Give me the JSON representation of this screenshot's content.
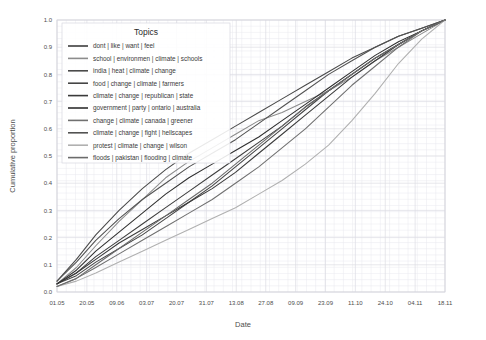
{
  "chart_data": {
    "type": "line",
    "title": "",
    "xlabel": "Date",
    "ylabel": "Cumulative proportion",
    "legend_title": "Topics",
    "legend_position": "inside-top-left",
    "grid": true,
    "ylim": [
      0.0,
      1.0
    ],
    "yticks": [
      "0.0",
      "0.1",
      "0.2",
      "0.3",
      "0.4",
      "0.5",
      "0.6",
      "0.7",
      "0.8",
      "0.9",
      "1.0"
    ],
    "ytick_values": [
      0.0,
      0.1,
      0.2,
      0.3,
      0.4,
      0.5,
      0.6,
      0.7,
      0.8,
      0.9,
      1.0
    ],
    "xticks": [
      "01.05",
      "20.05",
      "09.06",
      "03.07",
      "20.07",
      "31.07",
      "13.08",
      "27.08",
      "09.09",
      "23.09",
      "11.10",
      "24.10",
      "04.11",
      "18.11"
    ],
    "xtick_positions": [
      0.0,
      0.077,
      0.154,
      0.231,
      0.308,
      0.385,
      0.462,
      0.538,
      0.615,
      0.692,
      0.769,
      0.846,
      0.923,
      1.0
    ],
    "series": [
      {
        "name": "dont | like | want | feel",
        "color": "#3d3d3d",
        "x": [
          0.0,
          0.05,
          0.1,
          0.16,
          0.22,
          0.28,
          0.34,
          0.4,
          0.46,
          0.52,
          0.58,
          0.64,
          0.7,
          0.76,
          0.82,
          0.88,
          0.94,
          1.0
        ],
        "values": [
          0.03,
          0.07,
          0.13,
          0.19,
          0.25,
          0.31,
          0.37,
          0.43,
          0.49,
          0.55,
          0.61,
          0.68,
          0.74,
          0.8,
          0.86,
          0.91,
          0.96,
          1.0
        ]
      },
      {
        "name": "school | environmen | climate | schools",
        "color": "#8c8c8c",
        "x": [
          0.0,
          0.05,
          0.1,
          0.16,
          0.22,
          0.28,
          0.34,
          0.4,
          0.46,
          0.52,
          0.58,
          0.64,
          0.7,
          0.76,
          0.82,
          0.88,
          0.94,
          1.0
        ],
        "values": [
          0.03,
          0.09,
          0.17,
          0.26,
          0.34,
          0.42,
          0.48,
          0.53,
          0.58,
          0.63,
          0.66,
          0.7,
          0.74,
          0.79,
          0.85,
          0.9,
          0.95,
          1.0
        ]
      },
      {
        "name": "india | heat | climate | change",
        "color": "#4a4a4a",
        "x": [
          0.0,
          0.05,
          0.1,
          0.16,
          0.22,
          0.28,
          0.34,
          0.4,
          0.46,
          0.52,
          0.58,
          0.64,
          0.7,
          0.76,
          0.82,
          0.88,
          0.94,
          1.0
        ],
        "values": [
          0.04,
          0.12,
          0.21,
          0.3,
          0.38,
          0.45,
          0.51,
          0.56,
          0.61,
          0.66,
          0.71,
          0.76,
          0.81,
          0.86,
          0.9,
          0.94,
          0.97,
          1.0
        ]
      },
      {
        "name": "food | change | climate | farmers",
        "color": "#454545",
        "x": [
          0.0,
          0.05,
          0.1,
          0.16,
          0.22,
          0.28,
          0.34,
          0.4,
          0.46,
          0.52,
          0.58,
          0.64,
          0.7,
          0.76,
          0.82,
          0.88,
          0.94,
          1.0
        ],
        "values": [
          0.03,
          0.06,
          0.11,
          0.16,
          0.21,
          0.27,
          0.33,
          0.39,
          0.46,
          0.53,
          0.6,
          0.67,
          0.74,
          0.8,
          0.86,
          0.91,
          0.96,
          1.0
        ]
      },
      {
        "name": "climate | change | republican | state",
        "color": "#3a3a3a",
        "x": [
          0.0,
          0.05,
          0.1,
          0.16,
          0.22,
          0.28,
          0.34,
          0.4,
          0.46,
          0.52,
          0.58,
          0.64,
          0.7,
          0.76,
          0.82,
          0.88,
          0.94,
          1.0
        ],
        "values": [
          0.03,
          0.07,
          0.12,
          0.18,
          0.23,
          0.28,
          0.33,
          0.38,
          0.44,
          0.51,
          0.58,
          0.65,
          0.72,
          0.79,
          0.85,
          0.91,
          0.96,
          1.0
        ]
      },
      {
        "name": "government | party | ontario | australia",
        "color": "#2f2f2f",
        "x": [
          0.0,
          0.05,
          0.1,
          0.16,
          0.22,
          0.28,
          0.34,
          0.4,
          0.46,
          0.52,
          0.58,
          0.64,
          0.7,
          0.76,
          0.82,
          0.88,
          0.94,
          1.0
        ],
        "values": [
          0.03,
          0.08,
          0.15,
          0.22,
          0.29,
          0.36,
          0.42,
          0.47,
          0.52,
          0.57,
          0.63,
          0.69,
          0.75,
          0.81,
          0.87,
          0.92,
          0.96,
          1.0
        ]
      },
      {
        "name": "change | climate | canada | greener",
        "color": "#707070",
        "x": [
          0.0,
          0.05,
          0.1,
          0.16,
          0.22,
          0.28,
          0.34,
          0.4,
          0.46,
          0.52,
          0.58,
          0.64,
          0.7,
          0.76,
          0.82,
          0.88,
          0.94,
          1.0
        ],
        "values": [
          0.02,
          0.05,
          0.09,
          0.14,
          0.19,
          0.24,
          0.29,
          0.34,
          0.4,
          0.46,
          0.53,
          0.6,
          0.68,
          0.76,
          0.83,
          0.9,
          0.96,
          1.0
        ]
      },
      {
        "name": "climate | change | fight | hellscapes",
        "color": "#525252",
        "x": [
          0.0,
          0.05,
          0.1,
          0.16,
          0.22,
          0.28,
          0.34,
          0.4,
          0.46,
          0.52,
          0.58,
          0.64,
          0.7,
          0.76,
          0.82,
          0.88,
          0.94,
          1.0
        ],
        "values": [
          0.04,
          0.11,
          0.19,
          0.27,
          0.34,
          0.4,
          0.46,
          0.51,
          0.56,
          0.62,
          0.68,
          0.74,
          0.8,
          0.85,
          0.9,
          0.94,
          0.97,
          1.0
        ]
      },
      {
        "name": "protest | climate | change | wilson",
        "color": "#b0b0b0",
        "x": [
          0.0,
          0.05,
          0.1,
          0.16,
          0.22,
          0.28,
          0.34,
          0.4,
          0.46,
          0.52,
          0.58,
          0.64,
          0.7,
          0.76,
          0.82,
          0.88,
          0.94,
          1.0
        ],
        "values": [
          0.02,
          0.04,
          0.07,
          0.11,
          0.15,
          0.19,
          0.23,
          0.27,
          0.31,
          0.36,
          0.41,
          0.47,
          0.54,
          0.63,
          0.73,
          0.84,
          0.93,
          1.0
        ]
      },
      {
        "name": "floods | pakistan | flooding | climate",
        "color": "#6b6b6b",
        "x": [
          0.0,
          0.05,
          0.1,
          0.16,
          0.22,
          0.28,
          0.34,
          0.4,
          0.46,
          0.52,
          0.58,
          0.64,
          0.7,
          0.76,
          0.82,
          0.88,
          0.94,
          1.0
        ],
        "values": [
          0.02,
          0.05,
          0.1,
          0.16,
          0.22,
          0.28,
          0.34,
          0.4,
          0.47,
          0.54,
          0.61,
          0.68,
          0.74,
          0.8,
          0.86,
          0.91,
          0.96,
          1.0
        ]
      }
    ]
  }
}
